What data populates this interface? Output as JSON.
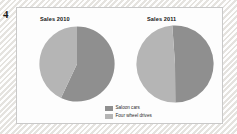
{
  "question": {
    "number": "4"
  },
  "panel": {
    "titles": {
      "left": "Sales 2010",
      "right": "Sales 2011"
    }
  },
  "legend": {
    "position": "bottom-center",
    "items": [
      {
        "label": "Saloon cars",
        "color": "#8f8f8f",
        "swatch_name": "legend-swatch-saloon-cars"
      },
      {
        "label": "Four wheel drives",
        "color": "#b5b5b5",
        "swatch_name": "legend-swatch-four-wheel-drives"
      }
    ]
  },
  "colors": {
    "saloon_cars": "#8f8f8f",
    "four_wheel_drives": "#b5b5b5",
    "panel_background": "#fdfdfd",
    "panel_border": "#c9c9c9",
    "page_background": "#f4f3f1",
    "text": "#151515"
  },
  "chart_data": [
    {
      "type": "pie",
      "name": "sales-2010",
      "title": "Sales 2010",
      "categories": [
        "Saloon cars",
        "Four wheel drives"
      ],
      "values": [
        57,
        43
      ],
      "unit": "%",
      "colors": [
        "#8f8f8f",
        "#b5b5b5"
      ],
      "start_angle_deg": 0,
      "direction": "clockwise",
      "legend": "bottom-center",
      "grid": false
    },
    {
      "type": "pie",
      "name": "sales-2011",
      "title": "Sales 2011",
      "categories": [
        "Saloon cars",
        "Four wheel drives"
      ],
      "values": [
        51,
        49
      ],
      "unit": "%",
      "colors": [
        "#8f8f8f",
        "#b5b5b5"
      ],
      "start_angle_deg": -4,
      "direction": "clockwise",
      "legend": "bottom-center",
      "grid": false
    }
  ]
}
